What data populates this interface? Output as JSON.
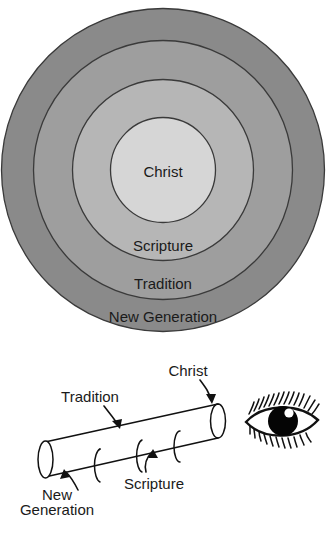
{
  "figure": {
    "title_visible": false,
    "colors": {
      "ring_outer": "#8a8a8a",
      "ring_mid1": "#9e9e9e",
      "ring_mid2": "#b6b6b6",
      "ring_core": "#d6d6d6",
      "stroke": "#3a3a3a",
      "line": "#111111",
      "tube_fill": "#ffffff",
      "background": "#ffffff"
    }
  },
  "circles": {
    "name": "concentric-rings-diagram",
    "rings": [
      {
        "key": "outer",
        "label": "New Generation",
        "fill": "#8a8a8a"
      },
      {
        "key": "mid1",
        "label": "Tradition",
        "fill": "#9e9e9e"
      },
      {
        "key": "mid2",
        "label": "Scripture",
        "fill": "#b6b6b6"
      },
      {
        "key": "core",
        "label": "Christ",
        "fill": "#d6d6d6"
      }
    ]
  },
  "telescope": {
    "name": "telescope-diagram",
    "segments": [
      {
        "key": "new-generation",
        "label_line1": "New",
        "label_line2": "Generation"
      },
      {
        "key": "tradition",
        "label": "Tradition"
      },
      {
        "key": "scripture",
        "label": "Scripture"
      },
      {
        "key": "christ",
        "label": "Christ"
      }
    ],
    "eye": {
      "label": "eye-icon"
    }
  }
}
